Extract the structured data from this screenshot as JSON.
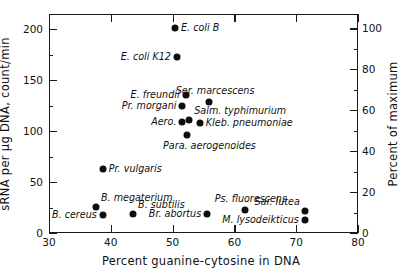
{
  "chart_data": {
    "type": "scatter",
    "title": "",
    "xlabel": "Percent guanine-cytosine in DNA",
    "ylabel": "sRNA per µg DNA, count/min",
    "ylabel_right": "Percent of maximum",
    "xlim": [
      30,
      80
    ],
    "ylim": [
      0,
      215
    ],
    "ylim_right": [
      0,
      107
    ],
    "xticks": [
      30,
      40,
      50,
      60,
      70,
      80
    ],
    "yticks": [
      0,
      50,
      100,
      150,
      200
    ],
    "yticks_right": [
      0,
      20,
      40,
      60,
      80,
      100
    ],
    "xminor": [
      35,
      45,
      55,
      65,
      75
    ],
    "yminor": [
      25,
      75,
      125,
      175
    ],
    "yminor_right": [
      10,
      30,
      50,
      70,
      90
    ],
    "grid": false,
    "legend": false,
    "marker": "filled-circle",
    "marker_color": "#0d0d0d",
    "points": [
      {
        "label": "E. coli B",
        "x": 50.4,
        "y": 201,
        "pos": "r"
      },
      {
        "label": "E. coli K12",
        "x": 50.7,
        "y": 173,
        "pos": "l"
      },
      {
        "label": "E. freundii",
        "x": 52.1,
        "y": 135,
        "pos": "l"
      },
      {
        "label": "Ser. marcescens",
        "x": 55.9,
        "y": 129,
        "pos": "above"
      },
      {
        "label": "Pr. morgani",
        "x": 51.6,
        "y": 125,
        "pos": "l"
      },
      {
        "label": "Salm. typhimurium",
        "x": 52.7,
        "y": 111,
        "pos": "above-right"
      },
      {
        "label": "Aero.",
        "x": 51.6,
        "y": 109,
        "pos": "l"
      },
      {
        "label": "Kleb. pneumoniae",
        "x": 54.4,
        "y": 108,
        "pos": "r"
      },
      {
        "label": "Para. aerogenoides",
        "x": 52.4,
        "y": 96,
        "pos": "below-right"
      },
      {
        "label": "Pr. vulgaris",
        "x": 38.7,
        "y": 63,
        "pos": "r"
      },
      {
        "label": "B. megaterium",
        "x": 37.6,
        "y": 26,
        "pos": "above-right"
      },
      {
        "label": "B. cereus",
        "x": 38.7,
        "y": 18,
        "pos": "l"
      },
      {
        "label": "B. subtilis",
        "x": 43.6,
        "y": 19,
        "pos": "above-right"
      },
      {
        "label": "Br. abortus",
        "x": 55.6,
        "y": 19,
        "pos": "l"
      },
      {
        "label": "Ps. fluorescens",
        "x": 61.7,
        "y": 23,
        "pos": "above"
      },
      {
        "label": "M. lysodeikticus",
        "x": 71.4,
        "y": 13,
        "pos": "l"
      },
      {
        "label": "Sar. lutea",
        "x": 71.4,
        "y": 22,
        "pos": "above-left"
      }
    ]
  }
}
